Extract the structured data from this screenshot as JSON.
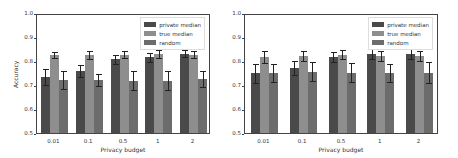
{
  "chart_data": [
    {
      "type": "bar",
      "title": "",
      "xlabel": "Privacy budget",
      "ylabel": "Accuracy",
      "ylim": [
        0.5,
        1.0
      ],
      "yticks": [
        "0.5",
        "0.6",
        "0.7",
        "0.8",
        "0.9",
        "1.0"
      ],
      "categories": [
        "0.01",
        "0.1",
        "0.5",
        "1",
        "2"
      ],
      "legend_position": "upper right",
      "series": [
        {
          "name": "private median",
          "color": "#4a4a4a",
          "values": [
            0.742,
            0.765,
            0.815,
            0.823,
            0.838
          ],
          "errors": [
            0.035,
            0.025,
            0.02,
            0.018,
            0.015
          ]
        },
        {
          "name": "true median",
          "color": "#8e8e8e",
          "values": [
            0.833,
            0.833,
            0.835,
            0.838,
            0.835
          ],
          "errors": [
            0.013,
            0.017,
            0.016,
            0.018,
            0.016
          ]
        },
        {
          "name": "random",
          "color": "#6c6c6c",
          "values": [
            0.73,
            0.73,
            0.727,
            0.727,
            0.733
          ],
          "errors": [
            0.037,
            0.025,
            0.04,
            0.04,
            0.035
          ]
        }
      ]
    },
    {
      "type": "bar",
      "title": "",
      "xlabel": "Privacy budget",
      "ylabel": "",
      "ylim": [
        0.5,
        1.0
      ],
      "yticks": [
        "0.5",
        "0.6",
        "0.7",
        "0.8",
        "0.9",
        "1.0"
      ],
      "categories": [
        "0.01",
        "0.1",
        "0.5",
        "1",
        "2"
      ],
      "legend_position": "upper right",
      "series": [
        {
          "name": "private median",
          "color": "#4a4a4a",
          "values": [
            0.757,
            0.78,
            0.825,
            0.837,
            0.838
          ],
          "errors": [
            0.04,
            0.03,
            0.022,
            0.02,
            0.02
          ]
        },
        {
          "name": "true median",
          "color": "#8e8e8e",
          "values": [
            0.823,
            0.83,
            0.835,
            0.83,
            0.83
          ],
          "errors": [
            0.025,
            0.022,
            0.02,
            0.02,
            0.02
          ]
        },
        {
          "name": "random",
          "color": "#6c6c6c",
          "values": [
            0.757,
            0.763,
            0.76,
            0.758,
            0.76
          ],
          "errors": [
            0.037,
            0.04,
            0.04,
            0.038,
            0.045
          ]
        }
      ]
    }
  ]
}
